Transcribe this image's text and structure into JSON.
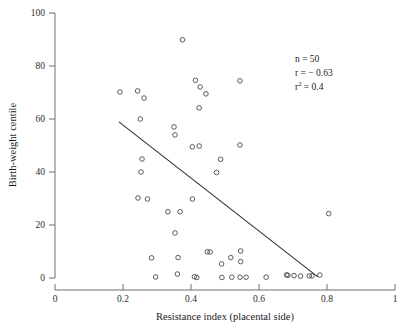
{
  "chart_data": {
    "type": "scatter",
    "title": "",
    "xlabel": "Resistance index (placental side)",
    "ylabel": "Birth-weight centile",
    "xlim": [
      0,
      1
    ],
    "ylim": [
      0,
      100
    ],
    "xticks": [
      0,
      0.2,
      0.4,
      0.6,
      0.8,
      1
    ],
    "xticklabels": [
      "0",
      "0.2",
      "0.4",
      "0.6",
      "0.8",
      "1"
    ],
    "yticks": [
      0,
      20,
      40,
      60,
      80,
      100
    ],
    "yticklabels": [
      "0",
      "20",
      "40",
      "60",
      "80",
      "100"
    ],
    "grid": false,
    "legend": null,
    "marker": "open-circle",
    "points": [
      {
        "x": 0.191,
        "y": 70.2
      },
      {
        "x": 0.243,
        "y": 70.6
      },
      {
        "x": 0.251,
        "y": 60.0
      },
      {
        "x": 0.256,
        "y": 44.9
      },
      {
        "x": 0.253,
        "y": 40.0
      },
      {
        "x": 0.244,
        "y": 30.2
      },
      {
        "x": 0.262,
        "y": 67.9
      },
      {
        "x": 0.272,
        "y": 29.8
      },
      {
        "x": 0.332,
        "y": 25.0
      },
      {
        "x": 0.368,
        "y": 25.0
      },
      {
        "x": 0.353,
        "y": 17.0
      },
      {
        "x": 0.284,
        "y": 7.6
      },
      {
        "x": 0.36,
        "y": 1.5
      },
      {
        "x": 0.41,
        "y": 0.5
      },
      {
        "x": 0.375,
        "y": 89.9
      },
      {
        "x": 0.413,
        "y": 74.6
      },
      {
        "x": 0.427,
        "y": 72.1
      },
      {
        "x": 0.444,
        "y": 69.5
      },
      {
        "x": 0.424,
        "y": 64.2
      },
      {
        "x": 0.544,
        "y": 74.4
      },
      {
        "x": 0.424,
        "y": 49.8
      },
      {
        "x": 0.35,
        "y": 57.0
      },
      {
        "x": 0.353,
        "y": 54.0
      },
      {
        "x": 0.404,
        "y": 49.5
      },
      {
        "x": 0.404,
        "y": 29.8
      },
      {
        "x": 0.487,
        "y": 44.8
      },
      {
        "x": 0.544,
        "y": 50.2
      },
      {
        "x": 0.475,
        "y": 39.8
      },
      {
        "x": 0.296,
        "y": 0.4
      },
      {
        "x": 0.417,
        "y": 0.2
      },
      {
        "x": 0.362,
        "y": 7.7
      },
      {
        "x": 0.448,
        "y": 9.9
      },
      {
        "x": 0.456,
        "y": 9.8
      },
      {
        "x": 0.517,
        "y": 7.7
      },
      {
        "x": 0.546,
        "y": 10.2
      },
      {
        "x": 0.546,
        "y": 6.2
      },
      {
        "x": 0.49,
        "y": 5.3
      },
      {
        "x": 0.491,
        "y": 0.2
      },
      {
        "x": 0.52,
        "y": 0.3
      },
      {
        "x": 0.544,
        "y": 0.3
      },
      {
        "x": 0.562,
        "y": 0.3
      },
      {
        "x": 0.621,
        "y": 0.3
      },
      {
        "x": 0.681,
        "y": 1.2
      },
      {
        "x": 0.685,
        "y": 1.0
      },
      {
        "x": 0.703,
        "y": 0.9
      },
      {
        "x": 0.722,
        "y": 0.7
      },
      {
        "x": 0.748,
        "y": 0.8
      },
      {
        "x": 0.756,
        "y": 0.8
      },
      {
        "x": 0.779,
        "y": 1.1
      },
      {
        "x": 0.805,
        "y": 24.3
      }
    ],
    "fit_line": {
      "x0": 0.188,
      "y0": 58.9,
      "x1": 0.773,
      "y1": 0.4
    },
    "annotations": {
      "n_label": "n = 50",
      "r_label": "r = − 0.63",
      "r2_prefix": "r",
      "r2_sup": "2",
      "r2_value": " = 0.4"
    }
  }
}
